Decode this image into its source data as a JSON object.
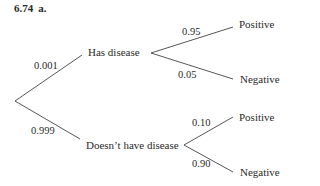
{
  "heading": {
    "number": "6.74",
    "part": "a."
  },
  "tree": {
    "root": {
      "branches": [
        {
          "label": "Has disease",
          "probability": "0.001",
          "children": [
            {
              "label": "Positive",
              "probability": "0.95"
            },
            {
              "label": "Negative",
              "probability": "0.05"
            }
          ]
        },
        {
          "label": "Doesn’t have disease",
          "probability": "0.999",
          "children": [
            {
              "label": "Positive",
              "probability": "0.10"
            },
            {
              "label": "Negative",
              "probability": "0.90"
            }
          ]
        }
      ]
    }
  }
}
